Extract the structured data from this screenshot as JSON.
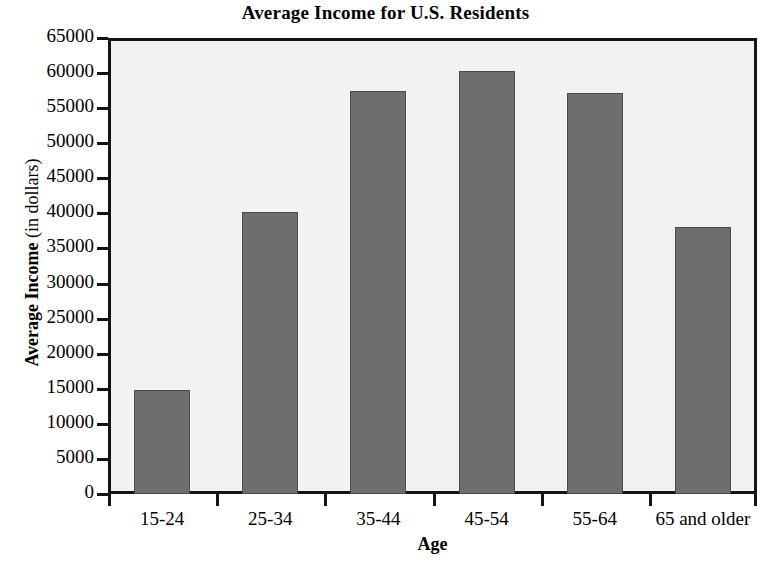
{
  "chart_data": {
    "type": "bar",
    "title": "Average Income for U.S. Residents",
    "xlabel": "Age",
    "ylabel_bold": "Average Income",
    "ylabel_light": "(in dollars)",
    "ylabel": "Average Income (in dollars)",
    "categories": [
      "15-24",
      "25-34",
      "35-44",
      "45-54",
      "55-64",
      "65 and older"
    ],
    "values": [
      14800,
      40200,
      57500,
      60300,
      57200,
      38000
    ],
    "ylim": [
      0,
      65000
    ],
    "ytick_step": 5000,
    "yticks": [
      0,
      5000,
      10000,
      15000,
      20000,
      25000,
      30000,
      35000,
      40000,
      45000,
      50000,
      55000,
      60000,
      65000
    ],
    "ytick_labels": [
      "0",
      "5000",
      "10000",
      "15000",
      "20000",
      "25000",
      "30000",
      "35000",
      "40000",
      "45000",
      "50000",
      "55000",
      "60000",
      "65000"
    ],
    "grid": false,
    "legend": false,
    "bar_color": "#6e6e6e",
    "bar_edge_color": "#4a4a4a",
    "plot_background": "#f2f2f0",
    "frame_color": "#141414",
    "text_color": "#000000"
  }
}
